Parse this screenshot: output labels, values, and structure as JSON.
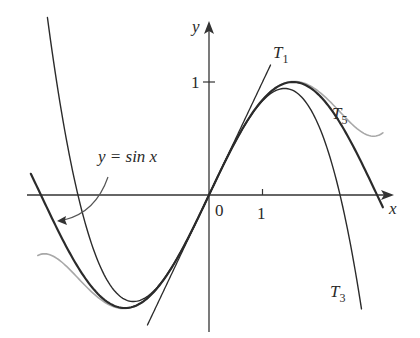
{
  "chart_data": {
    "type": "line",
    "title": "",
    "xlabel": "x",
    "ylabel": "y",
    "x_ticks": [
      {
        "value": 1,
        "label": "1"
      }
    ],
    "y_ticks": [
      {
        "value": 1,
        "label": "1"
      }
    ],
    "origin_label": "0",
    "grid": false,
    "legend": "inline labels",
    "series": [
      {
        "name": "y = sin x",
        "expr": "sin(x)",
        "x_range": [
          -3.33,
          3.25
        ],
        "color": "#2b2b2b",
        "width": 2.2
      },
      {
        "name": "T1",
        "expr": "x",
        "x_range": [
          -1.15,
          1.15
        ],
        "color": "#2b2b2b",
        "width": 1.3
      },
      {
        "name": "T3",
        "expr": "x - x^3/6",
        "x_range": [
          -3.02,
          2.85
        ],
        "color": "#2b2b2b",
        "width": 1.4
      },
      {
        "name": "T5",
        "expr": "x - x^3/6 + x^5/120",
        "x_range": [
          -3.2,
          3.25
        ],
        "color": "#a8a8a8",
        "width": 1.6
      }
    ],
    "annotations": [
      {
        "text": "y = sin x",
        "arrow_to": [
          -2.85,
          -0.3
        ]
      },
      {
        "text": "T1"
      },
      {
        "text": "T3"
      },
      {
        "text": "T5"
      }
    ]
  },
  "labels": {
    "y_axis": "y",
    "x_axis": "x",
    "origin": "0",
    "x_tick_1": "1",
    "y_tick_1": "1",
    "sin_label": "y = sin x",
    "t1_main": "T",
    "t1_sub": "1",
    "t3_main": "T",
    "t3_sub": "3",
    "t5_main": "T",
    "t5_sub": "5"
  },
  "frame": {
    "origin_px": [
      209,
      195
    ],
    "x_scale": 53.5,
    "y_scale": 113
  }
}
